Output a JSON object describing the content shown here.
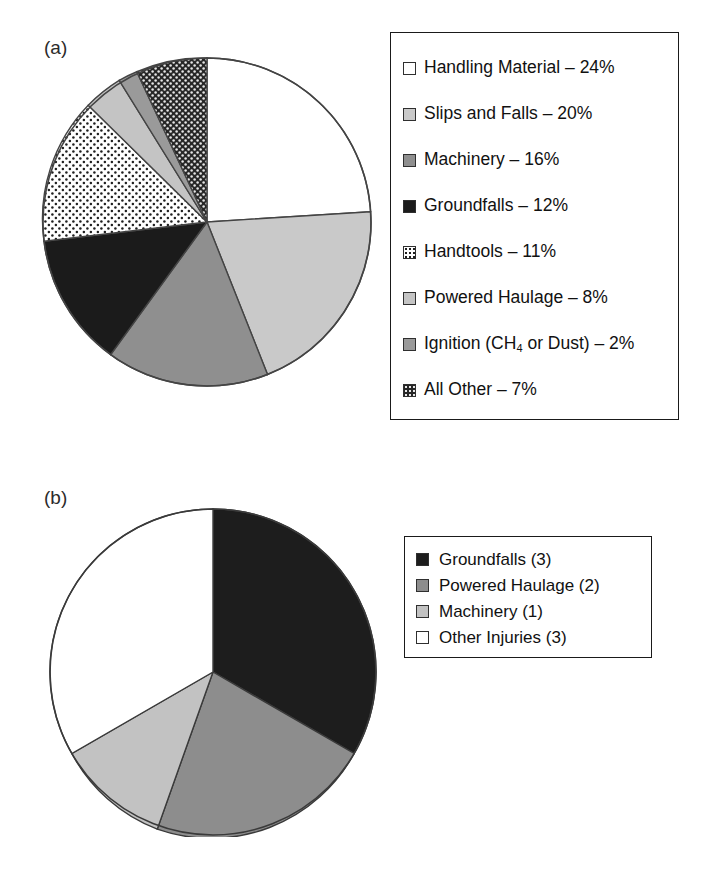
{
  "panels": {
    "a": {
      "label": "(a)"
    },
    "b": {
      "label": "(b)"
    }
  },
  "colors": {
    "outline": "#333333",
    "white": "#ffffff",
    "light_gray": "#c9c9c9",
    "mid_gray": "#8f8f8f",
    "black": "#1b1b1b",
    "dotted_bg": "#ffffff",
    "dotted_fg": "#1f1f1f",
    "checker_bg": "#262626",
    "checker_fg": "#e8e8e8"
  },
  "chart_data": [
    {
      "type": "pie",
      "panel": "(a)",
      "title": "",
      "legend_position": "right",
      "unit": "%",
      "total": 100,
      "categories": [
        "Handling Material",
        "Slips and Falls",
        "Machinery",
        "Groundfalls",
        "Handtools",
        "Powered Haulage",
        "Ignition (CH4 or Dust)",
        "All Other"
      ],
      "values": [
        24,
        20,
        16,
        12,
        11,
        8,
        2,
        7
      ],
      "legend_entries": [
        {
          "label": "Handling Material – 24%",
          "label_html": "Handling Material &#8211; 24%",
          "value": 24,
          "swatch": "white"
        },
        {
          "label": "Slips and Falls – 20%",
          "label_html": "Slips and Falls &#8211; 20%",
          "value": 20,
          "swatch": "light-gray"
        },
        {
          "label": "Machinery – 16%",
          "label_html": "Machinery &#8211; 16%",
          "value": 16,
          "swatch": "mid-gray"
        },
        {
          "label": "Groundfalls – 12%",
          "label_html": "Groundfalls &#8211; 12%",
          "value": 12,
          "swatch": "black"
        },
        {
          "label": "Handtools – 11%",
          "label_html": "Handtools &#8211; 11%",
          "value": 11,
          "swatch": "dotted"
        },
        {
          "label": "Powered Haulage – 8%",
          "label_html": "Powered Haulage &#8211; 8%",
          "value": 8,
          "swatch": "light-gray-2"
        },
        {
          "label": "Ignition (CH4 or Dust) – 2%",
          "label_html": "Ignition (CH<sub>4</sub> or Dust) &#8211; 2%",
          "value": 2,
          "swatch": "mid-gray-2"
        },
        {
          "label": "All Other – 7%",
          "label_html": "All Other &#8211; 7%",
          "value": 7,
          "swatch": "checker"
        }
      ]
    },
    {
      "type": "pie",
      "panel": "(b)",
      "title": "",
      "legend_position": "right",
      "unit": "count",
      "total": 9,
      "categories": [
        "Groundfalls",
        "Powered Haulage",
        "Machinery",
        "Other Injuries"
      ],
      "values": [
        3,
        2,
        1,
        3
      ],
      "legend_entries": [
        {
          "label": "Groundfalls (3)",
          "label_html": "Groundfalls (3)",
          "value": 3,
          "swatch": "pie-black"
        },
        {
          "label": "Powered Haulage (2)",
          "label_html": "Powered Haulage (2)",
          "value": 2,
          "swatch": "pie-mid"
        },
        {
          "label": "Machinery (1)",
          "label_html": "Machinery (1)",
          "value": 1,
          "swatch": "pie-light"
        },
        {
          "label": "Other Injuries (3)",
          "label_html": "Other Injuries (3)",
          "value": 3,
          "swatch": "white"
        }
      ]
    }
  ]
}
